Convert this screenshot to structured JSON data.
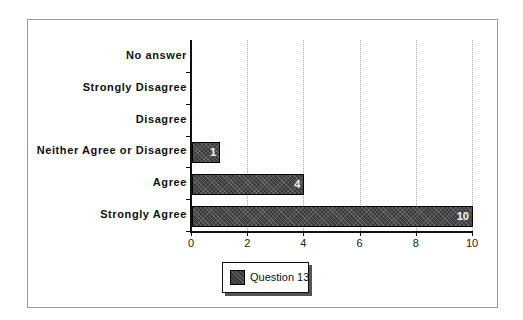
{
  "chart_data": {
    "type": "bar",
    "orientation": "horizontal",
    "title": "",
    "xlabel": "",
    "ylabel": "",
    "categories": [
      "No answer",
      "Strongly Disagree",
      "Disagree",
      "Neither Agree or Disagree",
      "Agree",
      "Strongly Agree"
    ],
    "series": [
      {
        "name": "Question 13",
        "values": [
          0,
          0,
          0,
          1,
          4,
          10
        ],
        "color": "#3a3a3a"
      }
    ],
    "xlim": [
      0,
      10
    ],
    "xticks": [
      "0",
      "2",
      "4",
      "6",
      "8",
      "10"
    ],
    "grid": "vertical dotted",
    "data_labels": [
      "",
      "",
      "",
      "1",
      "4",
      "10"
    ],
    "legend_position": "bottom"
  },
  "legend": {
    "label": "Question 13"
  }
}
